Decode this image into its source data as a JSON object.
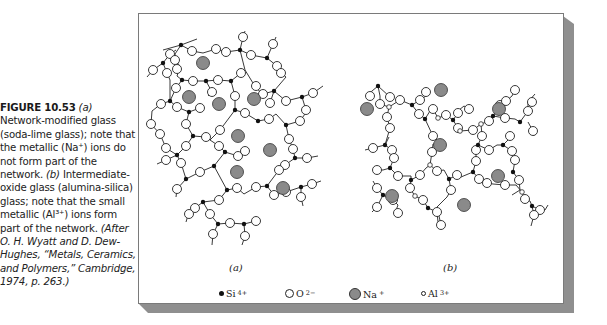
{
  "caption": {
    "figure_label": "FIGURE 10.53",
    "part_a_marker": "(a)",
    "part_a_text": "Network-modified glass (soda-lime glass); note that the metallic (Na⁺) ions do not form part of the network.",
    "part_b_marker": "(b)",
    "part_b_text": "Intermediate-oxide glass (alumina-silica) glass; note that the small metallic (Al³⁺) ions form part of the network.",
    "source": "(After O. H. Wyatt and D. Dew-Hughes, “Metals, Ceramics, and Polymers,” Cambridge, 1974, p. 263.)"
  },
  "figure": {
    "sublabel_a": "(a)",
    "sublabel_b": "(b)",
    "colors": {
      "panel_border": "#7a7a7a",
      "shadow": "#8f8f8f",
      "si_fill": "#111111",
      "o_fill": "#ffffff",
      "na_fill": "#8a8a8a",
      "al_fill": "#ffffff"
    }
  },
  "legend": [
    {
      "symbol": "si-dot",
      "label": "Si",
      "charge": "4+"
    },
    {
      "symbol": "o-circle",
      "label": "O",
      "charge": "2−"
    },
    {
      "symbol": "na-circle",
      "label": "Na",
      "charge": "+"
    },
    {
      "symbol": "al-circle",
      "label": "Al",
      "charge": "3+"
    }
  ]
}
